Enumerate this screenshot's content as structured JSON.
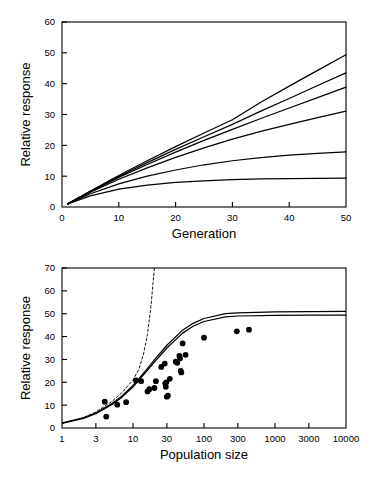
{
  "figure": {
    "background": "#ffffff",
    "line_color": "#000000",
    "point_color": "#000000"
  },
  "chart_data": [
    {
      "type": "line",
      "panel": "top",
      "title": "",
      "xlabel": "Generation",
      "ylabel": "Relative response",
      "xlim": [
        0,
        50
      ],
      "ylim": [
        0,
        60
      ],
      "xticks": [
        0,
        10,
        20,
        30,
        40,
        50
      ],
      "yticks": [
        0,
        10,
        20,
        30,
        40,
        50,
        60
      ],
      "grid": false,
      "legend": null,
      "series": [
        {
          "name": "curve-1-largest",
          "style": "solid",
          "x": [
            1,
            5,
            10,
            15,
            20,
            25,
            30,
            35,
            40,
            45,
            50
          ],
          "values": [
            1.0,
            5.2,
            10.2,
            15.0,
            19.6,
            24.0,
            28.3,
            34.0,
            39.2,
            44.3,
            49.4
          ]
        },
        {
          "name": "curve-2",
          "style": "solid",
          "x": [
            1,
            5,
            10,
            15,
            20,
            25,
            30,
            35,
            40,
            45,
            50
          ],
          "values": [
            1.0,
            5.1,
            9.9,
            14.4,
            18.7,
            22.8,
            26.8,
            31.1,
            35.2,
            39.4,
            43.5
          ]
        },
        {
          "name": "curve-3",
          "style": "solid",
          "x": [
            1,
            5,
            10,
            15,
            20,
            25,
            30,
            35,
            40,
            45,
            50
          ],
          "values": [
            1.0,
            5.0,
            9.6,
            13.8,
            17.8,
            21.6,
            25.2,
            28.7,
            32.1,
            35.5,
            38.9
          ]
        },
        {
          "name": "curve-4",
          "style": "solid",
          "x": [
            1,
            5,
            10,
            15,
            20,
            25,
            30,
            35,
            40,
            45,
            50
          ],
          "values": [
            1.0,
            4.8,
            9.0,
            12.7,
            16.1,
            19.2,
            22.0,
            24.5,
            26.8,
            29.0,
            31.1
          ]
        },
        {
          "name": "curve-5",
          "style": "solid",
          "x": [
            1,
            5,
            10,
            15,
            20,
            25,
            30,
            35,
            40,
            45,
            50
          ],
          "values": [
            1.0,
            4.3,
            7.5,
            10.0,
            12.0,
            13.7,
            15.0,
            16.0,
            16.8,
            17.4,
            17.9
          ]
        },
        {
          "name": "curve-6-smallest",
          "style": "solid",
          "x": [
            1,
            5,
            10,
            15,
            20,
            25,
            30,
            35,
            40,
            45,
            50
          ],
          "values": [
            1.0,
            3.6,
            5.8,
            7.1,
            8.0,
            8.5,
            8.9,
            9.1,
            9.2,
            9.3,
            9.4
          ]
        }
      ]
    },
    {
      "type": "scatter",
      "panel": "bottom",
      "title": "",
      "xlabel": "Population size",
      "ylabel": "Relative response",
      "xscale": "log",
      "xlim": [
        1,
        10000
      ],
      "ylim": [
        0,
        70
      ],
      "xticks": [
        1,
        3,
        10,
        30,
        100,
        300,
        1000,
        3000,
        10000
      ],
      "xtick_labels": [
        "1",
        "3",
        "10",
        "30",
        "100",
        "300",
        "1000",
        "3000",
        "10000"
      ],
      "yticks": [
        0,
        10,
        20,
        30,
        40,
        50,
        60,
        70
      ],
      "grid": false,
      "legend": null,
      "points": [
        [
          4.0,
          11.5
        ],
        [
          4.2,
          5.0
        ],
        [
          6.0,
          10.2
        ],
        [
          8.0,
          11.3
        ],
        [
          11.0,
          20.8
        ],
        [
          13.0,
          20.5
        ],
        [
          16.0,
          16.0
        ],
        [
          17.0,
          17.0
        ],
        [
          20.0,
          17.5
        ],
        [
          21.0,
          20.5
        ],
        [
          25.0,
          26.7
        ],
        [
          28.0,
          28.2
        ],
        [
          28.5,
          19.5
        ],
        [
          29.0,
          18.0
        ],
        [
          29.5,
          20.0
        ],
        [
          30.0,
          13.7
        ],
        [
          31.0,
          14.2
        ],
        [
          33.0,
          21.5
        ],
        [
          40.0,
          29.0
        ],
        [
          42.0,
          28.5
        ],
        [
          45.0,
          31.5
        ],
        [
          46.0,
          30.5
        ],
        [
          47.0,
          25.0
        ],
        [
          48.0,
          24.3
        ],
        [
          50.0,
          37.0
        ],
        [
          55.0,
          32.0
        ],
        [
          100.0,
          39.5
        ],
        [
          290.0,
          42.3
        ],
        [
          430.0,
          43.0
        ]
      ],
      "series": [
        {
          "name": "fitted-curve-upper",
          "style": "solid",
          "x": [
            1,
            2,
            3,
            5,
            7,
            10,
            15,
            20,
            30,
            50,
            70,
            100,
            200,
            300,
            1000,
            3000,
            10000
          ],
          "values": [
            2.2,
            4.4,
            6.6,
            10.6,
            14.0,
            18.6,
            25.0,
            29.8,
            36.2,
            42.8,
            45.8,
            47.9,
            50.0,
            50.4,
            50.8,
            50.9,
            51.0
          ]
        },
        {
          "name": "fitted-curve-lower",
          "style": "solid",
          "x": [
            1,
            2,
            3,
            5,
            7,
            10,
            15,
            20,
            30,
            50,
            70,
            100,
            200,
            300,
            1000,
            3000,
            10000
          ],
          "values": [
            2.0,
            4.2,
            6.3,
            10.2,
            13.5,
            18.0,
            24.2,
            28.8,
            35.0,
            41.5,
            44.5,
            46.6,
            48.6,
            49.0,
            49.3,
            49.4,
            49.4
          ]
        },
        {
          "name": "asymptote-reference-dashed",
          "style": "dashed",
          "x": [
            1,
            2,
            3,
            5,
            7,
            10,
            12,
            14,
            16,
            18,
            20
          ],
          "values": [
            2.0,
            4.5,
            7.0,
            11.5,
            15.5,
            21.0,
            25.5,
            32.0,
            41.0,
            54.0,
            70.0
          ]
        }
      ]
    }
  ]
}
